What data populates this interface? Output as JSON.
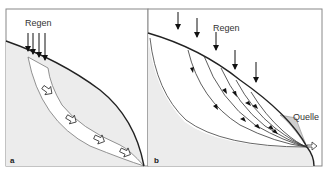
{
  "panels": [
    {
      "id": "a",
      "label": "a",
      "rain_label": "Regen",
      "description": "Slope with a permeable layer; rain infiltrates and water flows downslope within the layer (hollow arrows)"
    },
    {
      "id": "b",
      "label": "b",
      "rain_label": "Regen",
      "spring_label": "Quelle",
      "description": "Rain infiltrates over the slope; flow lines converge toward a spring at the foot of the slope"
    }
  ],
  "colors": {
    "ground_fill": "#ececec",
    "layer_fill": "#ffffff",
    "outline": "#222222",
    "frame": "#888888",
    "spring_fill": "#cfcfcf"
  }
}
